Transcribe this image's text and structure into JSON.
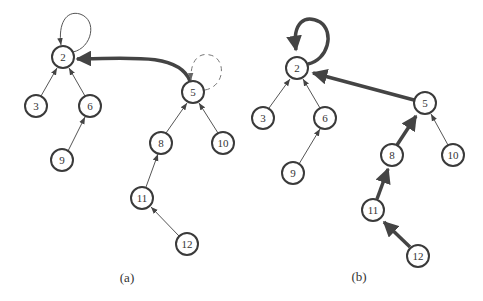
{
  "figure": {
    "panels": [
      {
        "id": "a",
        "label": "(a)",
        "nodes": [
          {
            "id": "2",
            "label": "2",
            "x": 63,
            "y": 57
          },
          {
            "id": "3",
            "label": "3",
            "x": 36,
            "y": 106
          },
          {
            "id": "6",
            "label": "6",
            "x": 90,
            "y": 106
          },
          {
            "id": "9",
            "label": "9",
            "x": 62,
            "y": 160
          },
          {
            "id": "5",
            "label": "5",
            "x": 193,
            "y": 92
          },
          {
            "id": "8",
            "label": "8",
            "x": 161,
            "y": 143
          },
          {
            "id": "10",
            "label": "10",
            "x": 223,
            "y": 143
          },
          {
            "id": "11",
            "label": "11",
            "x": 142,
            "y": 198
          },
          {
            "id": "12",
            "label": "12",
            "x": 187,
            "y": 244
          }
        ],
        "edges": [
          {
            "from": "2",
            "to": "2",
            "style": "thin-self-loop"
          },
          {
            "from": "3",
            "to": "2",
            "style": "thin"
          },
          {
            "from": "6",
            "to": "2",
            "style": "thin"
          },
          {
            "from": "9",
            "to": "6",
            "style": "thin"
          },
          {
            "from": "5",
            "to": "2",
            "style": "thick-curved"
          },
          {
            "from": "5",
            "to": "5",
            "style": "dashed-self-loop"
          },
          {
            "from": "8",
            "to": "5",
            "style": "thin"
          },
          {
            "from": "10",
            "to": "5",
            "style": "thin"
          },
          {
            "from": "11",
            "to": "8",
            "style": "thin"
          },
          {
            "from": "12",
            "to": "11",
            "style": "thin"
          }
        ]
      },
      {
        "id": "b",
        "label": "(b)",
        "nodes": [
          {
            "id": "2",
            "label": "2",
            "x": 297,
            "y": 68
          },
          {
            "id": "3",
            "label": "3",
            "x": 263,
            "y": 118
          },
          {
            "id": "6",
            "label": "6",
            "x": 325,
            "y": 118
          },
          {
            "id": "9",
            "label": "9",
            "x": 293,
            "y": 173
          },
          {
            "id": "5",
            "label": "5",
            "x": 425,
            "y": 103
          },
          {
            "id": "8",
            "label": "8",
            "x": 392,
            "y": 155
          },
          {
            "id": "10",
            "label": "10",
            "x": 453,
            "y": 155
          },
          {
            "id": "11",
            "label": "11",
            "x": 373,
            "y": 210
          },
          {
            "id": "12",
            "label": "12",
            "x": 418,
            "y": 256
          }
        ],
        "edges": [
          {
            "from": "2",
            "to": "2",
            "style": "thick-self-loop"
          },
          {
            "from": "3",
            "to": "2",
            "style": "thin"
          },
          {
            "from": "6",
            "to": "2",
            "style": "thin"
          },
          {
            "from": "9",
            "to": "6",
            "style": "thin"
          },
          {
            "from": "5",
            "to": "2",
            "style": "thick"
          },
          {
            "from": "8",
            "to": "5",
            "style": "thick"
          },
          {
            "from": "10",
            "to": "5",
            "style": "thin"
          },
          {
            "from": "11",
            "to": "8",
            "style": "thick"
          },
          {
            "from": "12",
            "to": "11",
            "style": "thick"
          }
        ]
      }
    ]
  }
}
